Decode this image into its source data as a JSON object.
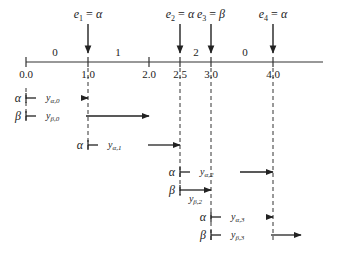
{
  "diagram": {
    "events": [
      {
        "name": "e",
        "sub": "1",
        "value": "α",
        "x": 88
      },
      {
        "name": "e",
        "sub": "2",
        "value": "α",
        "x": 180
      },
      {
        "name": "e",
        "sub": "3",
        "value": "β",
        "x": 211
      },
      {
        "name": "e",
        "sub": "4",
        "value": "α",
        "x": 273
      }
    ],
    "axis": {
      "ticks": [
        {
          "label": "0.0",
          "x": 26
        },
        {
          "label": "1.0",
          "x": 88
        },
        {
          "label": "2.0",
          "x": 149
        },
        {
          "label": "2.5",
          "x": 180
        },
        {
          "label": "3.0",
          "x": 211
        },
        {
          "label": "4.0",
          "x": 273
        }
      ],
      "interval_labels": [
        {
          "label": "0",
          "x": 55
        },
        {
          "label": "1",
          "x": 118
        },
        {
          "label": "2",
          "x": 196
        },
        {
          "label": "0",
          "x": 245
        }
      ]
    },
    "rows": [
      {
        "state": "α",
        "var": "y",
        "sub": "α,0",
        "start": 26,
        "end": 88,
        "y": 98
      },
      {
        "state": "β",
        "var": "y",
        "sub": "β,0",
        "start": 26,
        "end": 149,
        "y": 116
      },
      {
        "state": "α",
        "var": "y",
        "sub": "α,1",
        "start": 88,
        "end": 180,
        "y": 145
      },
      {
        "state": "α",
        "var": "y",
        "sub": "α,2",
        "start": 180,
        "end": 273,
        "y": 172
      },
      {
        "state": "β",
        "var": "y",
        "sub": "β,2",
        "start": 180,
        "end": 211,
        "y": 190
      },
      {
        "state": "α",
        "var": "y",
        "sub": "α,3",
        "start": 211,
        "end": 273,
        "y": 217
      },
      {
        "state": "β",
        "var": "y",
        "sub": "β,3",
        "start": 211,
        "end": 301,
        "y": 235
      }
    ]
  }
}
